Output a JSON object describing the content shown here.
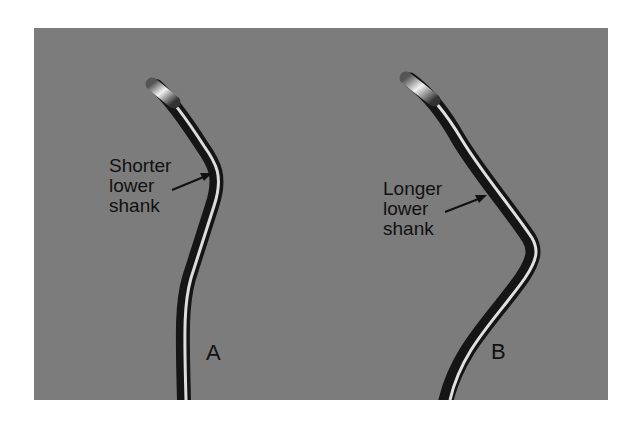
{
  "figure": {
    "background_color": "#7c7c7c",
    "instruments": [
      {
        "id": "A",
        "letter": "A",
        "label_lines": [
          "Shorter",
          "lower",
          "shank"
        ]
      },
      {
        "id": "B",
        "letter": "B",
        "label_lines": [
          "Longer",
          "lower",
          "shank"
        ]
      }
    ]
  }
}
